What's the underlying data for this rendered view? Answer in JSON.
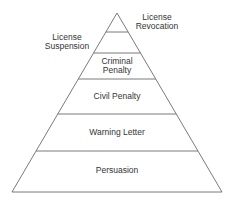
{
  "diagram": {
    "levels": [
      {
        "label": "License Revocation",
        "line1": "License",
        "line2": "Revocation"
      },
      {
        "label": "License Suspension",
        "line1": "License",
        "line2": "Suspension"
      },
      {
        "label": "Criminal Penalty",
        "line1": "Criminal",
        "line2": "Penalty"
      },
      {
        "label": "Civil Penalty"
      },
      {
        "label": "Warning Letter"
      },
      {
        "label": "Persuasion"
      }
    ],
    "colors": {
      "stroke": "#666666",
      "text": "#333333",
      "background": "#ffffff"
    }
  }
}
